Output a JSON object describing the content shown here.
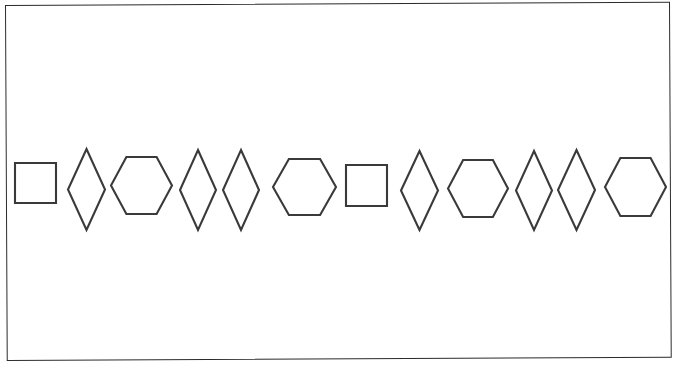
{
  "page": {
    "width": 675,
    "height": 371,
    "background_color": "#ffffff",
    "border_color": "#2b2b2b",
    "stroke_color": "#3a3a3a",
    "border": {
      "left": 5,
      "top": 5,
      "width": 665,
      "height": 356,
      "rotation_degrees": -0.28
    }
  },
  "pattern": {
    "description": "Single horizontal row of outlined geometric shapes forming a repeating sequence",
    "repeat_unit": [
      "square",
      "diamond",
      "hexagon",
      "diamond",
      "diamond",
      "hexagon"
    ],
    "repeat_count": 2,
    "total_shapes": 12,
    "shape_counts": {
      "square": 2,
      "diamond": 6,
      "hexagon": 4
    },
    "sequence": [
      "square",
      "diamond",
      "hexagon",
      "diamond",
      "diamond",
      "hexagon",
      "square",
      "diamond",
      "hexagon",
      "diamond",
      "diamond",
      "hexagon"
    ]
  },
  "shapes": [
    {
      "index": 1,
      "type": "square",
      "label": "square-1",
      "x": 14,
      "y": 162,
      "width": 43,
      "height": 42
    },
    {
      "index": 2,
      "type": "diamond",
      "label": "diamond-1",
      "x": 67,
      "y": 148,
      "width": 39,
      "height": 83
    },
    {
      "index": 3,
      "type": "hexagon",
      "label": "hexagon-1",
      "x": 110,
      "y": 156,
      "width": 63,
      "height": 59
    },
    {
      "index": 4,
      "type": "diamond",
      "label": "diamond-2",
      "x": 179,
      "y": 149,
      "width": 38,
      "height": 82
    },
    {
      "index": 5,
      "type": "diamond",
      "label": "diamond-3",
      "x": 222,
      "y": 149,
      "width": 38,
      "height": 82
    },
    {
      "index": 6,
      "type": "hexagon",
      "label": "hexagon-2",
      "x": 272,
      "y": 158,
      "width": 65,
      "height": 58
    },
    {
      "index": 7,
      "type": "square",
      "label": "square-2",
      "x": 345,
      "y": 164,
      "width": 43,
      "height": 43
    },
    {
      "index": 8,
      "type": "diamond",
      "label": "diamond-4",
      "x": 400,
      "y": 150,
      "width": 39,
      "height": 81
    },
    {
      "index": 9,
      "type": "hexagon",
      "label": "hexagon-3",
      "x": 447,
      "y": 159,
      "width": 62,
      "height": 59
    },
    {
      "index": 10,
      "type": "diamond",
      "label": "diamond-5",
      "x": 515,
      "y": 150,
      "width": 38,
      "height": 81
    },
    {
      "index": 11,
      "type": "diamond",
      "label": "diamond-6",
      "x": 557,
      "y": 149,
      "width": 39,
      "height": 82
    },
    {
      "index": 12,
      "type": "hexagon",
      "label": "hexagon-4",
      "x": 604,
      "y": 157,
      "width": 63,
      "height": 60
    }
  ]
}
